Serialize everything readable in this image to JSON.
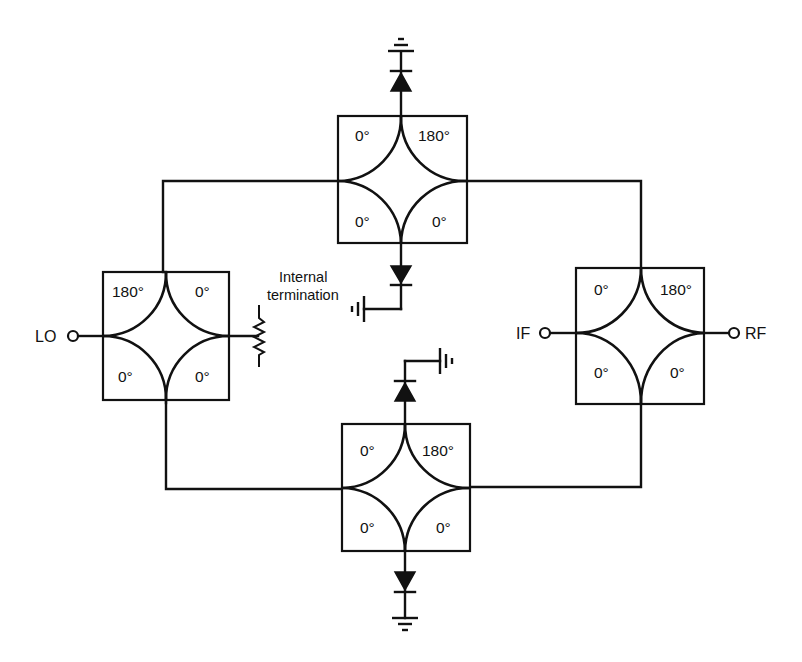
{
  "diagram": {
    "type": "double-balanced mixer schematic (four 180-degree hybrid couplers with four diodes)",
    "colors": {
      "line": "#111111",
      "background": "#ffffff"
    },
    "hybrids": [
      {
        "id": "top",
        "ports": {
          "top_left": "0°",
          "top_right": "180°",
          "bottom_left": "0°",
          "bottom_right": "0°"
        }
      },
      {
        "id": "left",
        "ports": {
          "top_left": "180°",
          "top_right": "0°",
          "bottom_left": "0°",
          "bottom_right": "0°"
        }
      },
      {
        "id": "right",
        "ports": {
          "top_left": "0°",
          "top_right": "180°",
          "bottom_left": "0°",
          "bottom_right": "0°"
        }
      },
      {
        "id": "bottom",
        "ports": {
          "top_left": "0°",
          "top_right": "180°",
          "bottom_left": "0°",
          "bottom_right": "0°"
        }
      }
    ],
    "ports": {
      "lo": "LO",
      "if": "IF",
      "rf": "RF"
    },
    "annotations": {
      "internal_termination_line1": "Internal",
      "internal_termination_line2": "termination"
    },
    "diodes": [
      {
        "location": "top hybrid, top port",
        "direction": "toward ground (up)",
        "ground": "top"
      },
      {
        "location": "top hybrid, bottom port",
        "direction": "down",
        "ground": "left"
      },
      {
        "location": "bottom hybrid, top port",
        "direction": "up",
        "ground": "right"
      },
      {
        "location": "bottom hybrid, bottom port",
        "direction": "down",
        "ground": "bottom"
      }
    ]
  }
}
